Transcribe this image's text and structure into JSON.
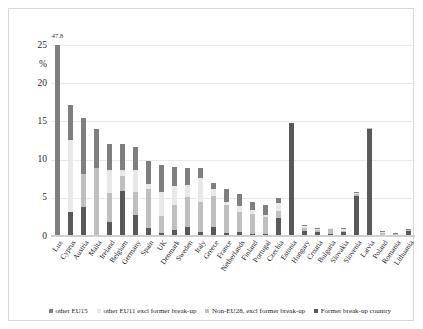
{
  "chart_data": {
    "type": "bar",
    "subtype": "stacked-bar",
    "title": "",
    "xlabel": "",
    "ylabel": "%",
    "ylim": [
      0,
      25
    ],
    "yticks": [
      0,
      5,
      10,
      15,
      20,
      25
    ],
    "ytick_labels": [
      "0",
      "5",
      "10",
      "15",
      "20",
      "25"
    ],
    "grid": true,
    "legend_position": "bottom",
    "annotations": [
      {
        "category": "Lux",
        "text": "47.8",
        "note": "bar truncated at axis maximum; true total 47.8%"
      }
    ],
    "series": [
      {
        "name": "other EU15",
        "color": "#7f7f7f"
      },
      {
        "name": "other EU11 excl former break-up",
        "color": "#e8e8e8"
      },
      {
        "name": "Non-EU28, excl former break-up",
        "color": "#bfbfbf"
      },
      {
        "name": "Former break-up country",
        "color": "#595959"
      }
    ],
    "categories": [
      "Lux",
      "Cyprus",
      "Austria",
      "Malta",
      "Ireland",
      "Belgium",
      "Germany",
      "Spain",
      "UK",
      "Denmark",
      "Sweden",
      "Italy",
      "Greece",
      "France",
      "Netherlands",
      "Finland",
      "Portugal",
      "Czechia",
      "Estonia",
      "Hungary",
      "Croatia",
      "Bulgaria",
      "Slovakia",
      "Slovenia",
      "Latvia",
      "Poland",
      "Romania",
      "Lithuania"
    ],
    "totals": [
      47.8,
      17.2,
      15.5,
      14.0,
      12.0,
      12.0,
      11.7,
      9.8,
      9.3,
      9.0,
      8.9,
      8.9,
      7.0,
      6.2,
      5.5,
      4.4,
      4.0,
      5.0,
      14.8,
      1.5,
      1.0,
      1.1,
      1.0,
      5.7,
      14.1,
      0.6,
      0.4,
      0.9
    ],
    "stacks": [
      {
        "category": "Lux",
        "other_eu15": 25.0,
        "other_eu11": 0.0,
        "non_eu28": 0.0,
        "former_breakup": 0.0
      },
      {
        "category": "Cyprus",
        "other_eu15": 4.6,
        "other_eu11": 9.4,
        "non_eu28": 0.0,
        "former_breakup": 3.2
      },
      {
        "category": "Austria",
        "other_eu15": 7.4,
        "other_eu11": 0.0,
        "non_eu28": 4.3,
        "former_breakup": 3.8
      },
      {
        "category": "Malta",
        "other_eu15": 5.1,
        "other_eu11": 0.0,
        "non_eu28": 8.9,
        "former_breakup": 0.0
      },
      {
        "category": "Ireland",
        "other_eu15": 3.3,
        "other_eu11": 3.1,
        "non_eu28": 3.8,
        "former_breakup": 1.8
      },
      {
        "category": "Belgium",
        "other_eu15": 3.3,
        "other_eu11": 0.9,
        "non_eu28": 1.9,
        "former_breakup": 5.9
      },
      {
        "category": "Germany",
        "other_eu15": 3.0,
        "other_eu11": 2.9,
        "non_eu28": 3.0,
        "former_breakup": 2.8
      },
      {
        "category": "Spain",
        "other_eu15": 3.0,
        "other_eu11": 0.6,
        "non_eu28": 5.2,
        "former_breakup": 1.0
      },
      {
        "category": "UK",
        "other_eu15": 3.6,
        "other_eu11": 3.1,
        "non_eu28": 2.2,
        "former_breakup": 0.4
      },
      {
        "category": "Denmark",
        "other_eu15": 2.5,
        "other_eu11": 2.4,
        "non_eu28": 3.3,
        "former_breakup": 0.8
      },
      {
        "category": "Sweden",
        "other_eu15": 2.2,
        "other_eu11": 1.6,
        "non_eu28": 3.9,
        "former_breakup": 1.2
      },
      {
        "category": "Italy",
        "other_eu15": 1.3,
        "other_eu11": 3.2,
        "non_eu28": 3.9,
        "former_breakup": 0.5
      },
      {
        "category": "Greece",
        "other_eu15": 0.8,
        "other_eu11": 1.0,
        "non_eu28": 4.0,
        "former_breakup": 1.2
      },
      {
        "category": "France",
        "other_eu15": 1.7,
        "other_eu11": 0.5,
        "non_eu28": 3.6,
        "former_breakup": 0.4
      },
      {
        "category": "Netherlands",
        "other_eu15": 1.6,
        "other_eu11": 0.7,
        "non_eu28": 2.7,
        "former_breakup": 0.5
      },
      {
        "category": "Finland",
        "other_eu15": 1.0,
        "other_eu11": 0.5,
        "non_eu28": 2.6,
        "former_breakup": 0.3
      },
      {
        "category": "Portugal",
        "other_eu15": 1.2,
        "other_eu11": 0.3,
        "non_eu28": 2.3,
        "former_breakup": 0.2
      },
      {
        "category": "Czechia",
        "other_eu15": 0.7,
        "other_eu11": 1.0,
        "non_eu28": 1.0,
        "former_breakup": 2.3
      },
      {
        "category": "Estonia",
        "other_eu15": 0.0,
        "other_eu11": 0.0,
        "non_eu28": 0.0,
        "former_breakup": 14.8
      },
      {
        "category": "Hungary",
        "other_eu15": 0.2,
        "other_eu11": 0.2,
        "non_eu28": 0.4,
        "former_breakup": 0.7
      },
      {
        "category": "Croatia",
        "other_eu15": 0.1,
        "other_eu11": 0.1,
        "non_eu28": 0.3,
        "former_breakup": 0.5
      },
      {
        "category": "Bulgaria",
        "other_eu15": 0.1,
        "other_eu11": 0.1,
        "non_eu28": 0.6,
        "former_breakup": 0.3
      },
      {
        "category": "Slovakia",
        "other_eu15": 0.1,
        "other_eu11": 0.2,
        "non_eu28": 0.2,
        "former_breakup": 0.5
      },
      {
        "category": "Slovenia",
        "other_eu15": 0.1,
        "other_eu11": 0.1,
        "non_eu28": 0.3,
        "former_breakup": 5.2
      },
      {
        "category": "Latvia",
        "other_eu15": 0.0,
        "other_eu11": 0.0,
        "non_eu28": 0.1,
        "former_breakup": 14.0
      },
      {
        "category": "Poland",
        "other_eu15": 0.1,
        "other_eu11": 0.1,
        "non_eu28": 0.3,
        "former_breakup": 0.1
      },
      {
        "category": "Romania",
        "other_eu15": 0.1,
        "other_eu11": 0.0,
        "non_eu28": 0.2,
        "former_breakup": 0.1
      },
      {
        "category": "Lithuania",
        "other_eu15": 0.1,
        "other_eu11": 0.0,
        "non_eu28": 0.1,
        "former_breakup": 0.7
      }
    ]
  }
}
